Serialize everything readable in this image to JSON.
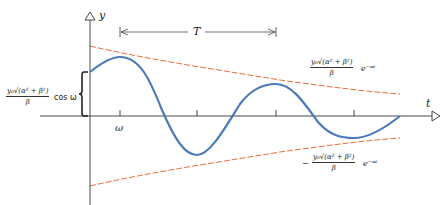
{
  "diagram": {
    "axes": {
      "y_label": "y",
      "x_label": "t"
    },
    "tick_label": "ω",
    "period_label": "T",
    "initial_value_label": {
      "numerator": "y₀√(α² + β²)",
      "denominator": "β",
      "suffix": "cos ω"
    },
    "upper_envelope_label": {
      "numerator": "y₀√(α² + β²)",
      "denominator": "β",
      "suffix": "e⁻ᵅᵗ"
    },
    "lower_envelope_label": {
      "prefix": "−",
      "numerator": "y₀√(α² + β²)",
      "denominator": "β",
      "suffix": "e⁻ᵅᵗ"
    },
    "colors": {
      "wave": "#4a7ab8",
      "envelope": "#e8703a",
      "axes": "#333333"
    }
  }
}
